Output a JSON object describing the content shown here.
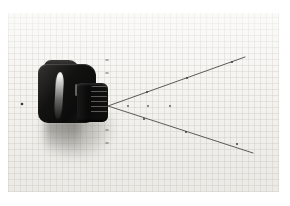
{
  "photo": {
    "description": "Black compact camera on millimeter graph paper, lens pointing right, with drawn field-of-view measurement lines",
    "colors": {
      "page_background": "#ffffff",
      "paper": "#f5f4f1",
      "paper_grid": "#c4c2ba",
      "camera_black": "#121211",
      "camera_gloss": "#f0efec",
      "camera_shadow": "#6e6c66",
      "ink": "#4c4a45",
      "mark": "#3f3e3a"
    },
    "fov_drawing": {
      "vertex": [
        108,
        106
      ],
      "upper_line_end": [
        245,
        57
      ],
      "lower_line_end": [
        253,
        153
      ],
      "upper_line_marks": [
        [
          147,
          92
        ],
        [
          187,
          78
        ],
        [
          232,
          62
        ]
      ],
      "lower_line_marks": [
        [
          144,
          119
        ],
        [
          186,
          132
        ],
        [
          237,
          144
        ]
      ],
      "axis_dots": [
        [
          128,
          106
        ],
        [
          148,
          106
        ],
        [
          170,
          106
        ]
      ],
      "vertical_ticks": [
        [
          107,
          60
        ],
        [
          107,
          73
        ],
        [
          107,
          130
        ],
        [
          107,
          143
        ]
      ],
      "paper_dot": [
        22,
        104
      ]
    }
  }
}
